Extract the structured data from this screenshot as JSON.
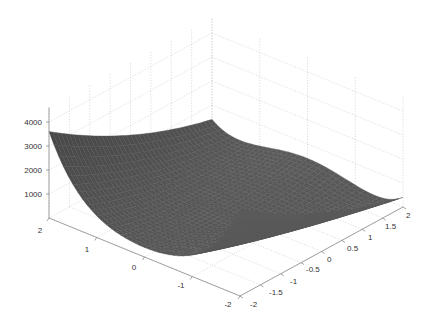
{
  "chart_data": {
    "type": "surface",
    "title": "",
    "function_description": "Rosenbrock-like surface z = (1-x)^2 + 100*(y-x^2)^2",
    "xlabel": "",
    "ylabel": "",
    "zlabel": "",
    "x_ticks": [
      "-2",
      "-1",
      "0",
      "1",
      "2"
    ],
    "y_ticks": [
      "-2",
      "-1.5",
      "-1",
      "-0.5",
      "0",
      "0.5",
      "1",
      "1.5",
      "2"
    ],
    "z_ticks": [
      "1000",
      "2000",
      "3000",
      "4000"
    ],
    "x_range": [
      -2,
      2
    ],
    "y_range": [
      -2,
      2
    ],
    "z_range": [
      0,
      4000
    ],
    "grid": true,
    "colormap": "gray",
    "notable_values": {
      "corner_left_z": 1300,
      "corner_back_z": 3900,
      "corner_right_z": 3600,
      "min_valley_z": 0
    }
  },
  "axes": {
    "z_tick_labels": [
      "1000",
      "2000",
      "3000",
      "4000"
    ],
    "x_tick_labels": [
      "2",
      "1",
      "0",
      "-1",
      "-2"
    ],
    "y_tick_labels": [
      "-2",
      "-1.5",
      "-1",
      "-0.5",
      "0",
      "0.5",
      "1",
      "1.5",
      "2"
    ]
  },
  "colors": {
    "background": "#ffffff",
    "grid": "#c8c8c8",
    "axis": "#8a8a8a",
    "surface_dark": "#1e1e1e",
    "surface_light": "#9a9a9a"
  }
}
